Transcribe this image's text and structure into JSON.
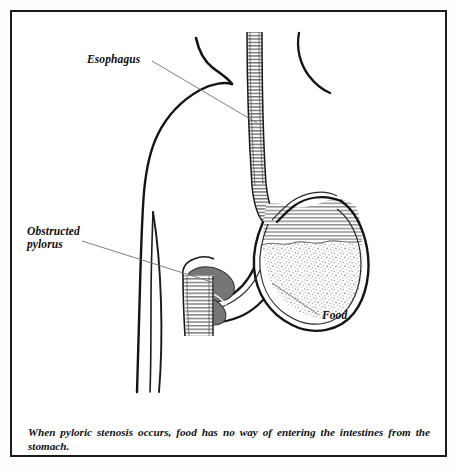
{
  "figure": {
    "caption": "When pyloric stenosis occurs, food has no way of entering the intestines from the stomach.",
    "frame_color": "#1b1b1b",
    "background_color": "#ffffff"
  },
  "labels": {
    "esophagus": "Esophagus",
    "obstructed_pylorus": "Obstructed\npylorus",
    "food": "Food"
  },
  "colors": {
    "outline": "#111111",
    "leader_line": "#6f6f6f",
    "pylorus_muscle": "#767676",
    "stomach_wall": "#1a1a1a",
    "hatching": "#555555",
    "food_stipple": "#8a8a8a",
    "body_outline": "#151515"
  },
  "anatomy": {
    "parts": [
      "torso-outline",
      "neck-outline",
      "arm-outline",
      "esophagus",
      "stomach",
      "gastric-gas-hatching",
      "food-mass",
      "obstructed-pylorus",
      "duodenum"
    ]
  }
}
